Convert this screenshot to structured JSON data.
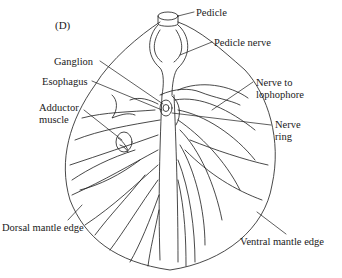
{
  "figure": {
    "panel_label": "(D)",
    "labels": {
      "pedicle": "Pedicle",
      "pedicle_nerve": "Pedicle nerve",
      "ganglion": "Ganglion",
      "esophagus": "Esophagus",
      "adductor_line1": "Adductor",
      "adductor_line2": "muscle",
      "nerve_to_line1": "Nerve to",
      "nerve_to_line2": "lophophore",
      "nerve_ring_line1": "Nerve",
      "nerve_ring_line2": "ring",
      "dorsal_mantle_edge": "Dorsal mantle edge",
      "ventral_mantle_edge": "Ventral mantle edge"
    },
    "colors": {
      "ink": "#1a1a1a",
      "background": "#ffffff"
    }
  }
}
